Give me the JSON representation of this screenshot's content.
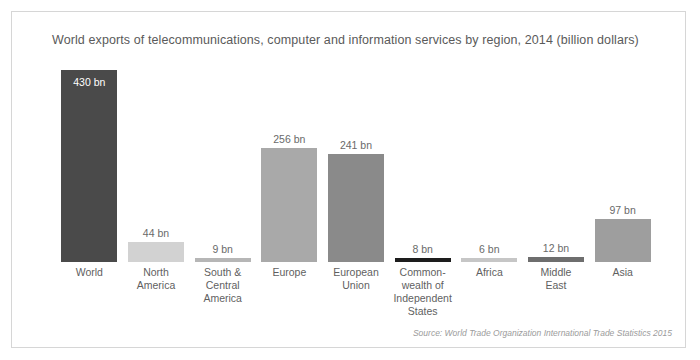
{
  "figure": {
    "title": "World exports of telecommunications, computer and information services by region, 2014 (billion dollars)",
    "source": "Source: World Trade Organization International Trade Statistics 2015",
    "background_color": "#ffffff",
    "border_color": "#d6d6d6",
    "text_color": "#5a5a5a"
  },
  "chart_data": {
    "type": "bar",
    "title": "World exports of telecommunications, computer and information services by region, 2014 (billion dollars)",
    "xlabel": "",
    "ylabel": "",
    "ylim": [
      0,
      430
    ],
    "grid": false,
    "legend": false,
    "unit_suffix": "bn",
    "categories": [
      "World",
      "North America",
      "South & Central America",
      "Europe",
      "European Union",
      "Common-wealth of Independent States",
      "Africa",
      "Middle East",
      "Asia"
    ],
    "category_lines": [
      [
        "World"
      ],
      [
        "North",
        "America"
      ],
      [
        "South &",
        "Central",
        "America"
      ],
      [
        "Europe"
      ],
      [
        "European",
        "Union"
      ],
      [
        "Common-",
        "wealth of",
        "Independent",
        "States"
      ],
      [
        "Africa"
      ],
      [
        "Middle",
        "East"
      ],
      [
        "Asia"
      ]
    ],
    "values": [
      430,
      44,
      9,
      256,
      241,
      8,
      6,
      12,
      97
    ],
    "value_labels": [
      "430 bn",
      "44 bn",
      "9 bn",
      "256 bn",
      "241 bn",
      "8 bn",
      "6 bn",
      "12 bn",
      "97 bn"
    ],
    "bar_colors": [
      "#4a4a4a",
      "#d2d2d2",
      "#b6b6b6",
      "#a9a9a9",
      "#8a8a8a",
      "#1d1d1d",
      "#c6c6c6",
      "#6e6e6e",
      "#9e9e9e"
    ],
    "label_positions": [
      "inside",
      "above",
      "above",
      "above",
      "above",
      "above",
      "above",
      "above",
      "above"
    ]
  }
}
